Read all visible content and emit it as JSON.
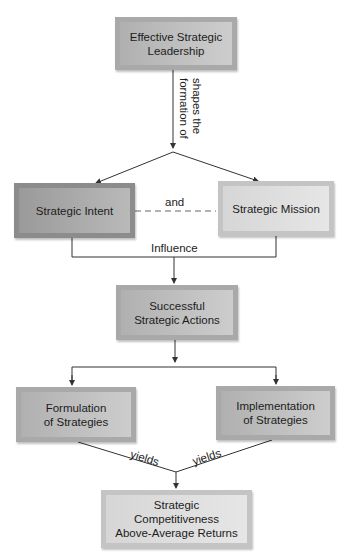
{
  "nodes": {
    "leadership": "Effective Strategic\nLeadership",
    "intent": "Strategic Intent",
    "mission": "Strategic Mission",
    "actions": "Successful\nStrategic Actions",
    "formulation": "Formulation\nof Strategies",
    "implementation": "Implementation\nof Strategies",
    "outcome": "Strategic\nCompetitiveness\nAbove-Average Returns"
  },
  "edge_labels": {
    "shapes": "shapes the\nformation of",
    "and": "and",
    "influence": "Influence",
    "yields_left": "yields",
    "yields_right": "yields"
  },
  "colors": {
    "line": "#333333",
    "box_dark": "#8c8c8c",
    "box_light": "#d6d6d6"
  }
}
